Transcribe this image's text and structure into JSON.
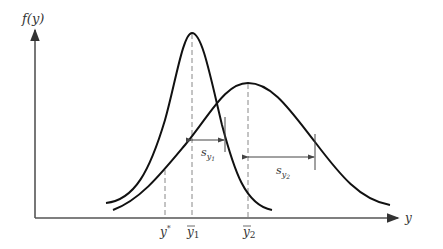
{
  "diagram": {
    "y_axis_label": "f(y)",
    "x_axis_label": "y",
    "x_markers": [
      {
        "label": "y*",
        "base": "y",
        "sup": "*"
      },
      {
        "label": "ȳ1",
        "base": "y",
        "sub": "1"
      },
      {
        "label": "ȳ2",
        "base": "y",
        "sub": "2"
      }
    ],
    "spread_labels": [
      {
        "label": "s_y1",
        "base": "s",
        "sub": "y",
        "subsub": "1"
      },
      {
        "label": "s_y2",
        "base": "s",
        "sub": "y",
        "subsub": "2"
      }
    ],
    "curves": [
      {
        "name": "distribution-1",
        "mean_px": 192,
        "peak_px": 33,
        "description": "narrow, tall"
      },
      {
        "name": "distribution-2",
        "mean_px": 248,
        "peak_px": 83,
        "description": "wide, short"
      }
    ],
    "colors": {
      "curve": "#111111",
      "axis": "#555555",
      "dash": "#888888"
    }
  }
}
